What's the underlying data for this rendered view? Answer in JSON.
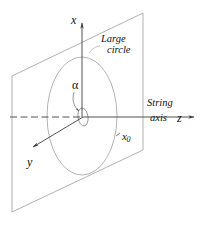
{
  "figure": {
    "background_color": "#ffffff",
    "line_color": "#3f3f3f",
    "plane_stroke": "#8f8f8f",
    "circle_stroke": "#9a9a9a",
    "text_color": "#111111",
    "width": 203,
    "height": 227
  },
  "axes": {
    "x": {
      "label": "x",
      "direction": "up"
    },
    "y": {
      "label": "y",
      "direction": "down-left"
    },
    "z": {
      "label": "z",
      "direction": "right"
    }
  },
  "labels": {
    "large_circle_line1": "Large",
    "large_circle_line2": "circle",
    "string_line1": "String",
    "string_line2": "axis",
    "angle": "α",
    "radius_point": "x",
    "radius_point_subscript": "0"
  },
  "geometry": {
    "plane": {
      "name": "vertical-plane",
      "corners": [
        [
          12,
          76
        ],
        [
          143,
          13
        ],
        [
          143,
          150
        ],
        [
          12,
          212
        ]
      ]
    },
    "large_circle": {
      "name": "large-circle",
      "center": [
        82,
        116
      ],
      "rx": 35,
      "ry": 59
    },
    "small_circle": {
      "name": "small-circle",
      "center": [
        83,
        117
      ],
      "rx": 5,
      "ry": 9
    },
    "origin": [
      83,
      117
    ],
    "z_axis_tip": [
      198,
      117
    ],
    "x_axis_tip": [
      82,
      19
    ],
    "y_axis_tip": [
      31,
      148
    ]
  }
}
